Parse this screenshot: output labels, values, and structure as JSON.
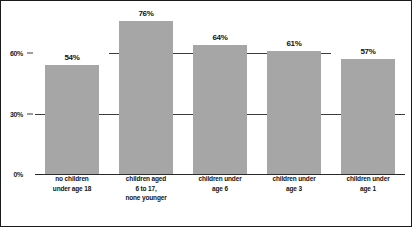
{
  "chart_data": {
    "type": "bar",
    "title": "",
    "subtitle": "",
    "xlabel": "",
    "ylabel": "",
    "categories": [
      "no children\nunder age 18",
      "children aged\n6 to 17,\nnone younger",
      "children under\nage 6",
      "children under\nage 3",
      "children under\nage 1"
    ],
    "values": [
      54,
      76,
      64,
      61,
      57
    ],
    "value_labels": [
      "54%",
      "76%",
      "64%",
      "61%",
      "57%"
    ],
    "ylim": [
      0,
      80
    ],
    "yticks": [
      0,
      30,
      60
    ],
    "ytick_labels": [
      "0%",
      "30%",
      "60%"
    ],
    "grid": true,
    "legend": "none",
    "bar_color": "#a6a6a6",
    "text_color": "#131313",
    "frame_color": "#1b1b1b",
    "background": "#ffffff"
  },
  "axis": {
    "y_ticks": [
      {
        "label": "0%",
        "value": 0
      },
      {
        "label": "30%",
        "value": 30
      },
      {
        "label": "60%",
        "value": 60
      }
    ]
  },
  "bars": [
    {
      "value": 54,
      "value_label": "54%",
      "category_lines": [
        "no children",
        "under age 18"
      ]
    },
    {
      "value": 76,
      "value_label": "76%",
      "category_lines": [
        "children aged",
        "6 to 17,",
        "none younger"
      ]
    },
    {
      "value": 64,
      "value_label": "64%",
      "category_lines": [
        "children under",
        "age 6"
      ]
    },
    {
      "value": 61,
      "value_label": "61%",
      "category_lines": [
        "children under",
        "age 3"
      ]
    },
    {
      "value": 57,
      "value_label": "57%",
      "category_lines": [
        "children under",
        "age 1"
      ]
    }
  ]
}
